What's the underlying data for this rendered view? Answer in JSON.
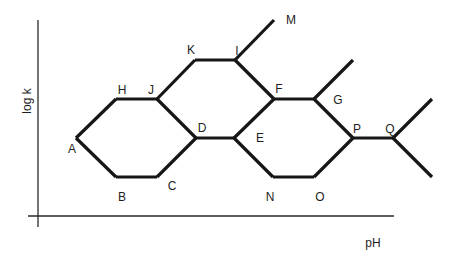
{
  "diagram": {
    "type": "reaction-path diagram",
    "axes": {
      "y_label": "log k",
      "x_label": "pH"
    },
    "vertices": {
      "A": [
        76,
        138
      ],
      "B": [
        116,
        177
      ],
      "C": [
        157,
        177
      ],
      "D": [
        196,
        138
      ],
      "E": [
        234,
        138
      ],
      "F": [
        274,
        99
      ],
      "G": [
        314,
        99
      ],
      "H": [
        116,
        99
      ],
      "I": [
        235,
        60
      ],
      "J": [
        157,
        99
      ],
      "K": [
        195,
        60
      ],
      "M": [
        274,
        20
      ],
      "N": [
        273,
        177
      ],
      "O": [
        314,
        177
      ],
      "P": [
        353,
        138
      ],
      "Q": [
        393,
        138
      ],
      "G_end": [
        353,
        60
      ],
      "Q_up_end": [
        432,
        99
      ],
      "Q_down_end": [
        432,
        177
      ]
    },
    "edges": [
      [
        "A",
        "H"
      ],
      [
        "H",
        "J"
      ],
      [
        "J",
        "D"
      ],
      [
        "A",
        "B"
      ],
      [
        "B",
        "C"
      ],
      [
        "C",
        "D"
      ],
      [
        "J",
        "K"
      ],
      [
        "K",
        "I"
      ],
      [
        "I",
        "M"
      ],
      [
        "I",
        "F"
      ],
      [
        "D",
        "E"
      ],
      [
        "E",
        "F"
      ],
      [
        "F",
        "G"
      ],
      [
        "G",
        "G_end"
      ],
      [
        "E",
        "N"
      ],
      [
        "N",
        "O"
      ],
      [
        "O",
        "P"
      ],
      [
        "G",
        "P"
      ],
      [
        "P",
        "Q"
      ],
      [
        "Q",
        "Q_up_end"
      ],
      [
        "Q",
        "Q_down_end"
      ]
    ],
    "labels": [
      {
        "id": "A",
        "text": "A",
        "x": 72,
        "y": 153
      },
      {
        "id": "B",
        "text": "B",
        "x": 122,
        "y": 201
      },
      {
        "id": "C",
        "text": "C",
        "x": 172,
        "y": 190
      },
      {
        "id": "D",
        "text": "D",
        "x": 202,
        "y": 132
      },
      {
        "id": "E",
        "text": "E",
        "x": 260,
        "y": 142
      },
      {
        "id": "F",
        "text": "F",
        "x": 279,
        "y": 93
      },
      {
        "id": "G",
        "text": "G",
        "x": 338,
        "y": 104
      },
      {
        "id": "H",
        "text": "H",
        "x": 122,
        "y": 94
      },
      {
        "id": "I",
        "text": "I",
        "x": 237,
        "y": 55
      },
      {
        "id": "J",
        "text": "J",
        "x": 151,
        "y": 94
      },
      {
        "id": "K",
        "text": "K",
        "x": 191,
        "y": 54
      },
      {
        "id": "M",
        "text": "M",
        "x": 291,
        "y": 24
      },
      {
        "id": "N",
        "text": "N",
        "x": 270,
        "y": 201
      },
      {
        "id": "O",
        "text": "O",
        "x": 320,
        "y": 201
      },
      {
        "id": "P",
        "text": "P",
        "x": 357,
        "y": 133
      },
      {
        "id": "Q",
        "text": "Q",
        "x": 390,
        "y": 133
      }
    ]
  }
}
